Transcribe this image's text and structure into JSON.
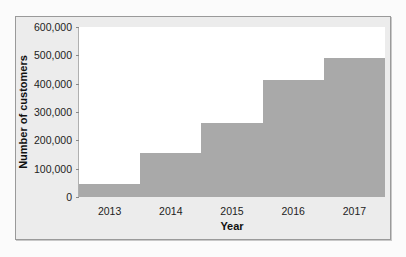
{
  "chart_data": {
    "type": "bar",
    "title": "",
    "xlabel": "Year",
    "ylabel": "Number of customers",
    "categories": [
      "2013",
      "2014",
      "2015",
      "2016",
      "2017"
    ],
    "values": [
      45000,
      155000,
      260000,
      412000,
      490000
    ],
    "ylim": [
      0,
      600000
    ],
    "yticks": [
      0,
      100000,
      200000,
      300000,
      400000,
      500000,
      600000
    ],
    "ytick_labels": [
      "0",
      "100,000",
      "200,000",
      "300,000",
      "400,000",
      "500,000",
      "600,000"
    ],
    "grid": false,
    "legend": null,
    "bar_color": "#a9a9a9",
    "bar_gap": 0
  }
}
